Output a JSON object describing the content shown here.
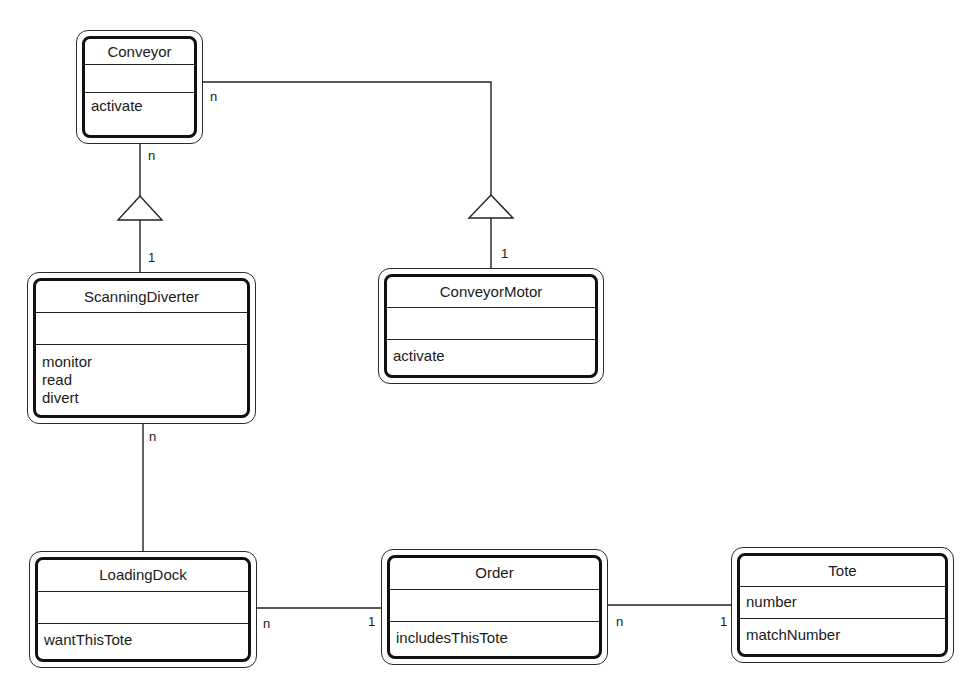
{
  "diagram": {
    "type": "class-diagram",
    "classes": {
      "conveyor": {
        "name": "Conveyor",
        "attributes": [],
        "operations": [
          "activate"
        ]
      },
      "scanning_diverter": {
        "name": "ScanningDiverter",
        "attributes": [],
        "operations": [
          "monitor",
          "read",
          "divert"
        ]
      },
      "conveyor_motor": {
        "name": "ConveyorMotor",
        "attributes": [],
        "operations": [
          "activate"
        ]
      },
      "loading_dock": {
        "name": "LoadingDock",
        "attributes": [],
        "operations": [
          "wantThisTote"
        ]
      },
      "order": {
        "name": "Order",
        "attributes": [],
        "operations": [
          "includesThisTote"
        ]
      },
      "tote": {
        "name": "Tote",
        "attributes": [
          "number"
        ],
        "operations": [
          "matchNumber"
        ]
      }
    },
    "relationships": [
      {
        "from": "Conveyor",
        "to": "ScanningDiverter",
        "kind": "aggregation-triangle",
        "from_mult": "n",
        "to_mult": "1"
      },
      {
        "from": "Conveyor",
        "to": "ConveyorMotor",
        "kind": "aggregation-triangle",
        "from_mult": "n",
        "to_mult": "1"
      },
      {
        "from": "ScanningDiverter",
        "to": "LoadingDock",
        "kind": "association",
        "from_mult": "n",
        "to_mult": ""
      },
      {
        "from": "LoadingDock",
        "to": "Order",
        "kind": "association",
        "from_mult": "n",
        "to_mult": "1"
      },
      {
        "from": "Order",
        "to": "Tote",
        "kind": "association",
        "from_mult": "n",
        "to_mult": "1"
      }
    ],
    "multiplicities": {
      "conveyor_down": "n",
      "conveyor_right": "n",
      "diverter_top": "1",
      "motor_top": "1",
      "diverter_bottom": "n",
      "dock_right": "n",
      "order_left": "1",
      "order_right": "n",
      "tote_left": "1"
    }
  }
}
